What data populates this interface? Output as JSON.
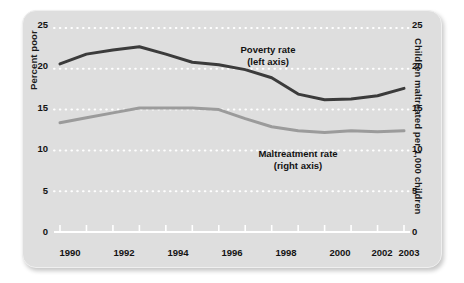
{
  "chart_data": {
    "type": "line",
    "title": "",
    "subtitle": "",
    "xlabel": "",
    "ylabel": "Percent poor",
    "ylabel_right": "Children maltreated per 1,000 children",
    "x": [
      1990,
      1991,
      1992,
      1993,
      1994,
      1995,
      1996,
      1997,
      1998,
      1999,
      2000,
      2001,
      2002,
      2003
    ],
    "xlim": [
      1990,
      2003
    ],
    "ylim": [
      0,
      25
    ],
    "ylim_right": [
      0,
      25
    ],
    "yticks": [
      0,
      5,
      10,
      15,
      20,
      25
    ],
    "yticks_right": [
      0,
      5,
      10,
      15,
      20,
      25
    ],
    "xticks": [
      1990,
      1991,
      1992,
      1993,
      1994,
      1995,
      1996,
      1997,
      1998,
      1999,
      2000,
      2001,
      2002,
      2003
    ],
    "xtick_labels_shown": [
      "1990",
      "1992",
      "1994",
      "1996",
      "1998",
      "2000",
      "2002",
      "2003"
    ],
    "grid": true,
    "grid_style": "dotted-white-horizontal",
    "legend_position": "inline-annotation",
    "series": [
      {
        "name": "Poverty rate",
        "axis": "left",
        "color": "#3b3b3b",
        "annotation": "Poverty rate",
        "annotation_sub": "(left axis)",
        "values": [
          20.6,
          21.8,
          22.3,
          22.7,
          21.8,
          20.8,
          20.5,
          19.9,
          18.9,
          16.9,
          16.2,
          16.3,
          16.7,
          17.6
        ]
      },
      {
        "name": "Maltreatment rate",
        "axis": "right",
        "color": "#9b9b9b",
        "annotation": "Maltreatment rate",
        "annotation_sub": "(right axis)",
        "values": [
          13.4,
          14.0,
          14.6,
          15.2,
          15.2,
          15.2,
          15.0,
          13.9,
          12.9,
          12.4,
          12.2,
          12.4,
          12.3,
          12.4
        ]
      }
    ]
  },
  "axes": {
    "left": {
      "title": "Percent poor",
      "tick_labels": [
        "25",
        "20",
        "15",
        "10",
        "5",
        "0"
      ]
    },
    "right": {
      "title": "Children maltreated per 1,000 children",
      "tick_labels": [
        "25",
        "20",
        "15",
        "10",
        "5",
        "0"
      ]
    },
    "bottom": {
      "tick_labels": [
        "1990",
        "1992",
        "1994",
        "1996",
        "1998",
        "2000",
        "2002",
        "2003"
      ]
    }
  },
  "annotations": {
    "poverty": {
      "line1": "Poverty rate",
      "line2": "(left axis)"
    },
    "maltreatment": {
      "line1": "Maltreatment rate",
      "line2": "(right axis)"
    }
  },
  "colors": {
    "panel_background": "#dedede",
    "poverty_line": "#3b3b3b",
    "maltreatment_line": "#9b9b9b",
    "gridline": "#ffffff",
    "axis_line": "#ffffff",
    "text": "#131313"
  }
}
